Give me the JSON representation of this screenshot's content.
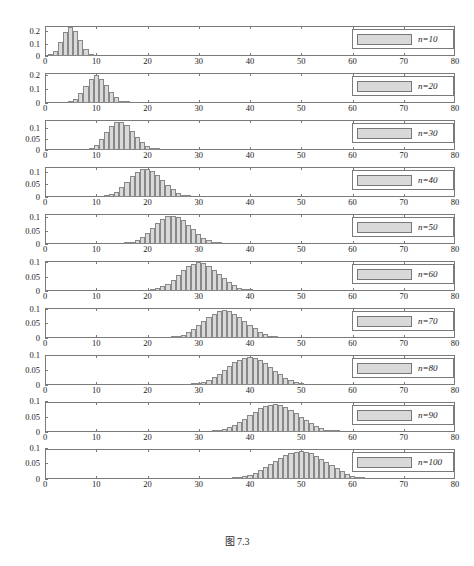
{
  "caption": "图 7.3",
  "axes": {
    "x_ticks": [
      0,
      10,
      20,
      30,
      40,
      50,
      60,
      70,
      80
    ],
    "x_min": 0,
    "x_max": 80,
    "y_ticks_tall": [
      0,
      0.1,
      0.2
    ],
    "y_ticks_tall_labels": [
      "0",
      "0.1",
      "0.2"
    ],
    "y_ticks_short": [
      0,
      0.05,
      0.1
    ],
    "y_ticks_short_labels": [
      "0",
      "0.05",
      "0.1"
    ],
    "grid": false
  },
  "colors": {
    "bar_fill": "#d9d9d9",
    "bar_edge": "#888888",
    "axis": "#7a7a7a",
    "text": "#1a1a1a"
  },
  "chart_data": {
    "type": "bar",
    "title": "图 7.3",
    "xlabel": "",
    "ylabel": "",
    "xlim": [
      0,
      80
    ],
    "legend_position": "top-right",
    "panels": [
      {
        "label": "n=10",
        "ylim": [
          0,
          0.24
        ],
        "ytick_labels": [
          "0",
          "0.1",
          "0.2"
        ],
        "yticks": [
          0,
          0.1,
          0.2
        ],
        "mean": 5,
        "bin_width": 1,
        "x": [
          1,
          2,
          3,
          4,
          5,
          6,
          7,
          8,
          9
        ],
        "values": [
          0.01,
          0.042,
          0.11,
          0.195,
          0.23,
          0.2,
          0.13,
          0.06,
          0.02
        ]
      },
      {
        "label": "n=20",
        "ylim": [
          0,
          0.215
        ],
        "ytick_labels": [
          "0",
          "0.1",
          "0.2"
        ],
        "yticks": [
          0,
          0.1,
          0.2
        ],
        "mean": 10,
        "bin_width": 1,
        "x": [
          5,
          6,
          7,
          8,
          9,
          10,
          11,
          12,
          13,
          14,
          15,
          16
        ],
        "values": [
          0.01,
          0.03,
          0.07,
          0.12,
          0.17,
          0.2,
          0.175,
          0.13,
          0.08,
          0.04,
          0.018,
          0.006
        ]
      },
      {
        "label": "n=30",
        "ylim": [
          0,
          0.135
        ],
        "ytick_labels": [
          "0",
          "0.05",
          "0.1"
        ],
        "yticks": [
          0,
          0.05,
          0.1
        ],
        "mean": 15,
        "bin_width": 1,
        "x": [
          9,
          10,
          11,
          12,
          13,
          14,
          15,
          16,
          17,
          18,
          19,
          20,
          21,
          22
        ],
        "values": [
          0.008,
          0.022,
          0.048,
          0.08,
          0.11,
          0.128,
          0.128,
          0.112,
          0.086,
          0.058,
          0.034,
          0.018,
          0.008,
          0.003
        ]
      },
      {
        "label": "n=40",
        "ylim": [
          0,
          0.118
        ],
        "ytick_labels": [
          "0",
          "0.05",
          "0.1"
        ],
        "yticks": [
          0,
          0.05,
          0.1
        ],
        "mean": 20,
        "bin_width": 1,
        "x": [
          12,
          13,
          14,
          15,
          16,
          17,
          18,
          19,
          20,
          21,
          22,
          23,
          24,
          25,
          26,
          27,
          28
        ],
        "values": [
          0.004,
          0.01,
          0.021,
          0.038,
          0.06,
          0.082,
          0.1,
          0.11,
          0.112,
          0.104,
          0.088,
          0.068,
          0.048,
          0.03,
          0.017,
          0.008,
          0.004
        ]
      },
      {
        "label": "n=50",
        "ylim": [
          0,
          0.112
        ],
        "ytick_labels": [
          "0",
          "0.05",
          "0.1"
        ],
        "yticks": [
          0,
          0.05,
          0.1
        ],
        "mean": 25,
        "bin_width": 1,
        "x": [
          16,
          17,
          18,
          19,
          20,
          21,
          22,
          23,
          24,
          25,
          26,
          27,
          28,
          29,
          30,
          31,
          32,
          33,
          34
        ],
        "values": [
          0.004,
          0.008,
          0.015,
          0.026,
          0.041,
          0.059,
          0.077,
          0.093,
          0.103,
          0.105,
          0.1,
          0.088,
          0.072,
          0.055,
          0.038,
          0.024,
          0.014,
          0.007,
          0.003
        ]
      },
      {
        "label": "n=60",
        "ylim": [
          0,
          0.105
        ],
        "ytick_labels": [
          "0",
          "0.05",
          "0.1"
        ],
        "yticks": [
          0,
          0.05,
          0.1
        ],
        "mean": 30,
        "bin_width": 1,
        "x": [
          21,
          22,
          23,
          24,
          25,
          26,
          27,
          28,
          29,
          30,
          31,
          32,
          33,
          34,
          35,
          36,
          37,
          38,
          39,
          40
        ],
        "values": [
          0.005,
          0.009,
          0.016,
          0.026,
          0.04,
          0.056,
          0.072,
          0.086,
          0.096,
          0.1,
          0.097,
          0.088,
          0.075,
          0.06,
          0.045,
          0.031,
          0.02,
          0.012,
          0.006,
          0.003
        ]
      },
      {
        "label": "n=70",
        "ylim": [
          0,
          0.103
        ],
        "ytick_labels": [
          "0",
          "0.05",
          "0.1"
        ],
        "yticks": [
          0,
          0.05,
          0.1
        ],
        "mean": 35,
        "bin_width": 1,
        "x": [
          25,
          26,
          27,
          28,
          29,
          30,
          31,
          32,
          33,
          34,
          35,
          36,
          37,
          38,
          39,
          40,
          41,
          42,
          43,
          44,
          45
        ],
        "values": [
          0.004,
          0.007,
          0.012,
          0.02,
          0.031,
          0.044,
          0.058,
          0.072,
          0.084,
          0.092,
          0.095,
          0.092,
          0.084,
          0.073,
          0.06,
          0.046,
          0.033,
          0.022,
          0.014,
          0.008,
          0.004
        ]
      },
      {
        "label": "n=80",
        "ylim": [
          0,
          0.1
        ],
        "ytick_labels": [
          "0",
          "0.05",
          "0.1"
        ],
        "yticks": [
          0,
          0.05,
          0.1
        ],
        "mean": 40,
        "bin_width": 1,
        "x": [
          29,
          30,
          31,
          32,
          33,
          34,
          35,
          36,
          37,
          38,
          39,
          40,
          41,
          42,
          43,
          44,
          45,
          46,
          47,
          48,
          49,
          50
        ],
        "values": [
          0.004,
          0.007,
          0.011,
          0.018,
          0.027,
          0.038,
          0.051,
          0.064,
          0.076,
          0.085,
          0.091,
          0.093,
          0.09,
          0.083,
          0.073,
          0.061,
          0.048,
          0.036,
          0.025,
          0.016,
          0.01,
          0.005
        ]
      },
      {
        "label": "n=90",
        "ylim": [
          0,
          0.098
        ],
        "ytick_labels": [
          "0",
          "0.05",
          "0.1"
        ],
        "yticks": [
          0,
          0.05,
          0.1
        ],
        "mean": 45,
        "bin_width": 1,
        "x": [
          33,
          34,
          35,
          36,
          37,
          38,
          39,
          40,
          41,
          42,
          43,
          44,
          45,
          46,
          47,
          48,
          49,
          50,
          51,
          52,
          53,
          54,
          55,
          56,
          57
        ],
        "values": [
          0.003,
          0.006,
          0.01,
          0.015,
          0.023,
          0.032,
          0.043,
          0.055,
          0.067,
          0.077,
          0.085,
          0.089,
          0.09,
          0.087,
          0.081,
          0.072,
          0.061,
          0.05,
          0.039,
          0.029,
          0.02,
          0.013,
          0.008,
          0.005,
          0.002
        ]
      },
      {
        "label": "n=100",
        "ylim": [
          0,
          0.096
        ],
        "ytick_labels": [
          "0",
          "0.05",
          "0.1"
        ],
        "yticks": [
          0,
          0.05,
          0.1
        ],
        "mean": 50,
        "bin_width": 1,
        "x": [
          37,
          38,
          39,
          40,
          41,
          42,
          43,
          44,
          45,
          46,
          47,
          48,
          49,
          50,
          51,
          52,
          53,
          54,
          55,
          56,
          57,
          58,
          59,
          60,
          61,
          62
        ],
        "values": [
          0.003,
          0.005,
          0.009,
          0.014,
          0.02,
          0.028,
          0.037,
          0.047,
          0.058,
          0.068,
          0.077,
          0.084,
          0.088,
          0.089,
          0.087,
          0.082,
          0.074,
          0.065,
          0.055,
          0.044,
          0.034,
          0.025,
          0.017,
          0.011,
          0.006,
          0.003
        ]
      }
    ]
  }
}
